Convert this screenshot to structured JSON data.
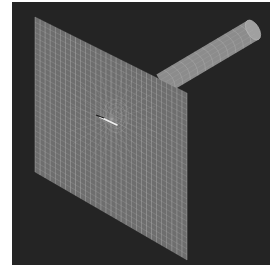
{
  "figure": {
    "colors": {
      "page_background": "#ffffff",
      "viewport_background": "#242424",
      "plate_fill": "#6e6e6e",
      "mesh_line": "#b8b8b8",
      "cylinder_fill": "#8c8c8c",
      "cylinder_cap": "#a0a0a0",
      "crack_highlight": "#f0f0f0"
    },
    "plate": {
      "corners": [
        [
          23,
          15
        ],
        [
          175,
          91
        ],
        [
          175,
          258
        ],
        [
          23,
          170
        ]
      ],
      "grid_columns": 30,
      "grid_rows": 30,
      "crack_center": [
        100,
        117
      ],
      "radial_spokes": 24
    },
    "cylinder": {
      "start": [
        150,
        82
      ],
      "end": [
        241,
        28
      ],
      "radius": 11,
      "rings": 12
    }
  }
}
